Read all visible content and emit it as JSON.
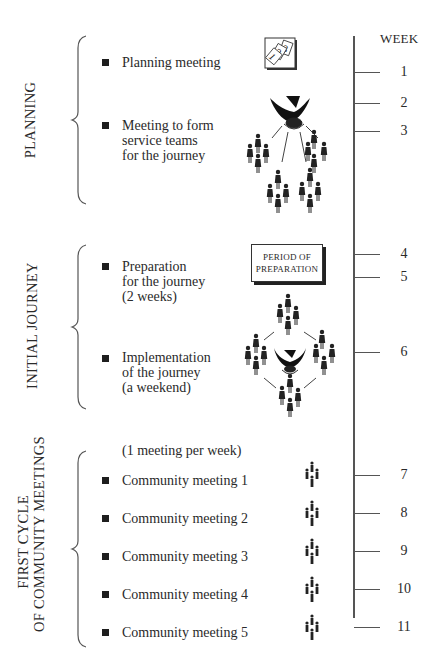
{
  "diagram": {
    "axis_title": "WEEK",
    "phases": [
      {
        "label": "PLANNING",
        "items": [
          {
            "text": [
              "Planning meeting"
            ],
            "icon": "calendar-123-icon"
          },
          {
            "text": [
              "Meeting to form",
              "service teams",
              "for the journey"
            ],
            "icon": "dove-with-teams-icon"
          }
        ]
      },
      {
        "label": "INITIAL JOURNEY",
        "items": [
          {
            "text": [
              "Preparation",
              "for the journey",
              "(2 weeks)"
            ],
            "icon": "period-of-preparation-box"
          },
          {
            "text": [
              "Implementation",
              "of the journey",
              "(a weekend)"
            ],
            "icon": "dove-surrounded-by-people-icon"
          }
        ]
      },
      {
        "label_lines": [
          "FIRST CYCLE",
          "OF COMMUNITY MEETINGS"
        ],
        "note": "(1 meeting per week)",
        "items": [
          {
            "text": [
              "Community meeting 1"
            ],
            "icon": "small-group-icon"
          },
          {
            "text": [
              "Community meeting 2"
            ],
            "icon": "small-group-icon"
          },
          {
            "text": [
              "Community meeting 3"
            ],
            "icon": "small-group-icon"
          },
          {
            "text": [
              "Community meeting 4"
            ],
            "icon": "small-group-icon"
          },
          {
            "text": [
              "Community meeting 5"
            ],
            "icon": "small-group-icon"
          }
        ]
      }
    ],
    "prep_box_lines": [
      "PERIOD OF",
      "PREPARATION"
    ],
    "weeks": [
      "1",
      "2",
      "3",
      "4",
      "5",
      "6",
      "7",
      "8",
      "9",
      "10",
      "11"
    ]
  }
}
